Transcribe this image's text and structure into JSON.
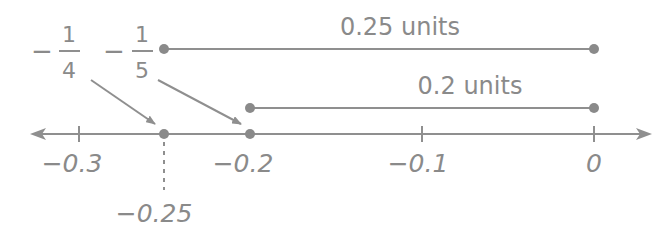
{
  "number_line": {
    "colors": {
      "line": "#8f8f8f",
      "text": "#8a8a8a",
      "point": "#8a8a8a"
    },
    "ticks": [
      {
        "value": -0.3,
        "label": "−0.3",
        "x": 79
      },
      {
        "value": -0.2,
        "label": "−0.2",
        "x": 250
      },
      {
        "value": -0.1,
        "label": "−0.1",
        "x": 422
      },
      {
        "value": 0,
        "label": "0",
        "x": 594
      }
    ],
    "points": [
      {
        "value": -0.25,
        "label": "−0.25",
        "x": 164
      },
      {
        "value": -0.2,
        "x": 250
      }
    ]
  },
  "fractions": [
    {
      "sign": "−",
      "numerator": "1",
      "denominator": "4",
      "points_to": -0.25
    },
    {
      "sign": "−",
      "numerator": "1",
      "denominator": "5",
      "points_to": -0.2
    }
  ],
  "distance_segments": [
    {
      "label": "0.25 units",
      "from": -0.25,
      "to": 0
    },
    {
      "label": "0.2 units",
      "from": -0.2,
      "to": 0
    }
  ],
  "extra_label": {
    "text": "−0.25"
  }
}
